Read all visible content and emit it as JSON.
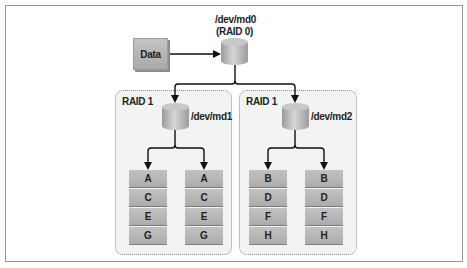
{
  "diagram": {
    "type": "RAID 10 (RAID 0 over RAID 1 mirrors)",
    "source_node": {
      "label": "Data"
    },
    "top_array": {
      "device": "/dev/md0",
      "level": "(RAID 0)"
    },
    "groups": [
      {
        "label": "RAID 1",
        "device": "/dev/md1",
        "disks": [
          {
            "blocks": [
              "A",
              "C",
              "E",
              "G"
            ]
          },
          {
            "blocks": [
              "A",
              "C",
              "E",
              "G"
            ]
          }
        ]
      },
      {
        "label": "RAID 1",
        "device": "/dev/md2",
        "disks": [
          {
            "blocks": [
              "B",
              "D",
              "F",
              "H"
            ]
          },
          {
            "blocks": [
              "B",
              "D",
              "F",
              "H"
            ]
          }
        ]
      }
    ],
    "colors": {
      "box_fill": "#b5b5b5",
      "group_fill": "#f3f3f3",
      "group_border": "#8a8a8a",
      "line": "#111111",
      "frame": "#9a9a9a"
    }
  }
}
